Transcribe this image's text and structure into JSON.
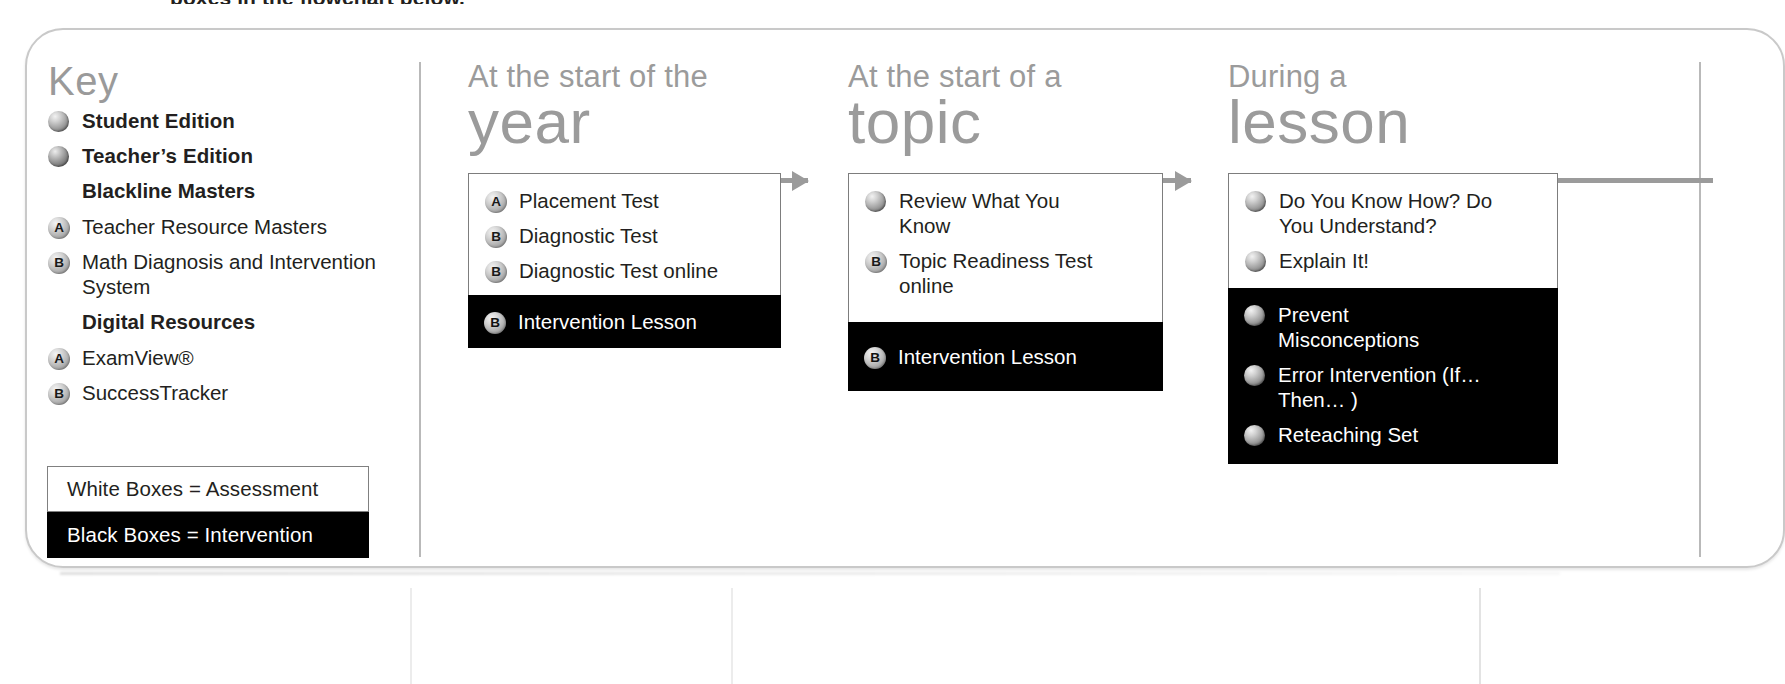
{
  "top_caption": "boxes in the flowchart below.",
  "key": {
    "title": "Key",
    "items": [
      {
        "marker": "sphere",
        "label": "Student Edition",
        "style": "bold"
      },
      {
        "marker": "sphere",
        "label": "Teacher’s Edition",
        "style": "bold"
      },
      {
        "marker": "none",
        "label": "Blackline Masters",
        "style": "heading"
      },
      {
        "marker": "A",
        "label": "Teacher Resource Masters",
        "style": "normal"
      },
      {
        "marker": "B",
        "label": "Math Diagnosis and Intervention System",
        "style": "normal"
      },
      {
        "marker": "none",
        "label": "Digital Resources",
        "style": "heading"
      },
      {
        "marker": "A",
        "label": "ExamView®",
        "style": "normal"
      },
      {
        "marker": "B",
        "label": "SuccessTracker",
        "style": "normal"
      }
    ],
    "legend": [
      {
        "text": "White Boxes = Assessment",
        "fill": "white"
      },
      {
        "text": "Black Boxes = Intervention",
        "fill": "black"
      }
    ]
  },
  "flowchart": {
    "columns": [
      {
        "kicker": "At the start of the",
        "big": "year",
        "assessment": [
          {
            "marker": "A",
            "label": "Placement Test"
          },
          {
            "marker": "B",
            "label": "Diagnostic Test"
          },
          {
            "marker": "B",
            "label": "Diagnostic Test online"
          }
        ],
        "intervention": [
          {
            "marker": "B",
            "label": "Intervention Lesson"
          }
        ]
      },
      {
        "kicker": "At the start of a",
        "big": "topic",
        "assessment": [
          {
            "marker": "sphere",
            "label": "Review What You Know"
          },
          {
            "marker": "B",
            "label": "Topic Readiness Test online"
          }
        ],
        "intervention": [
          {
            "marker": "B",
            "label": "Intervention Lesson"
          }
        ]
      },
      {
        "kicker": "During a",
        "big": "lesson",
        "assessment": [
          {
            "marker": "sphere",
            "label": "Do You Know How? Do You Understand?"
          },
          {
            "marker": "sphere",
            "label": "Explain It!"
          }
        ],
        "intervention": [
          {
            "marker": "sphere",
            "label": "Prevent Misconceptions"
          },
          {
            "marker": "sphere",
            "label": "Error Intervention (If… Then… )"
          },
          {
            "marker": "sphere",
            "label": "Reteaching Set"
          }
        ]
      }
    ]
  },
  "colors": {
    "heading_gray": "#9b9b9b",
    "text_black": "#231f20",
    "box_border": "#7d7d7d",
    "intervention_fill": "#000000"
  }
}
